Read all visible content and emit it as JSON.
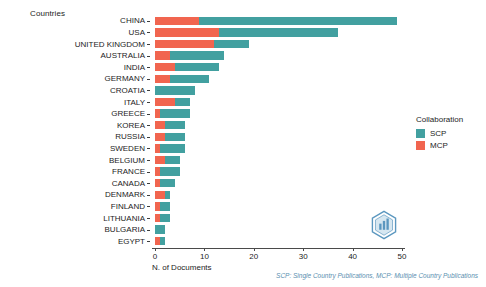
{
  "chart_data": {
    "type": "bar",
    "orientation": "horizontal",
    "stacked": true,
    "title": "",
    "xlabel": "N. of Documents",
    "ylabel": "Countries",
    "xlim": [
      0,
      50
    ],
    "xticks": [
      0,
      10,
      20,
      30,
      40,
      50
    ],
    "grid": false,
    "legend_position": "right",
    "categories": [
      "CHINA",
      "USA",
      "UNITED KINGDOM",
      "AUSTRALIA",
      "INDIA",
      "GERMANY",
      "CROATIA",
      "ITALY",
      "GREECE",
      "KOREA",
      "RUSSIA",
      "SWEDEN",
      "BELGIUM",
      "FRANCE",
      "CANADA",
      "DENMARK",
      "FINLAND",
      "LITHUANIA",
      "BULGARIA",
      "EGYPT"
    ],
    "series": [
      {
        "name": "MCP",
        "color": "#f1654f",
        "values": [
          9,
          13,
          12,
          3,
          4,
          3,
          0,
          4,
          1,
          2,
          2,
          1,
          2,
          1,
          1,
          2,
          1,
          1,
          0,
          1
        ]
      },
      {
        "name": "SCP",
        "color": "#42a0a0",
        "values": [
          40,
          24,
          7,
          11,
          9,
          8,
          8,
          3,
          6,
          4,
          4,
          5,
          3,
          4,
          3,
          1,
          2,
          2,
          2,
          1
        ]
      }
    ],
    "totals": [
      49,
      37,
      19,
      14,
      13,
      11,
      8,
      7,
      7,
      6,
      6,
      6,
      5,
      5,
      4,
      3,
      3,
      3,
      2,
      2
    ]
  },
  "legend": {
    "title": "Collaboration",
    "items": [
      {
        "label": "SCP",
        "color": "#42a0a0"
      },
      {
        "label": "MCP",
        "color": "#f1654f"
      }
    ]
  },
  "caption": "SCP: Single Country Publications, MCP: Multiple Country Publications",
  "colors": {
    "scp": "#42a0a0",
    "mcp": "#f1654f",
    "axis": "#4a4a4a",
    "text": "#1c1c1c",
    "caption": "#5b8fb0",
    "background": "#ffffff"
  }
}
